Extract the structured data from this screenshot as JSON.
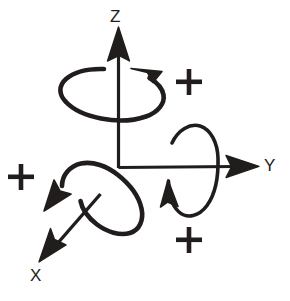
{
  "diagram": {
    "type": "hand-drawn-line-diagram",
    "background_color": "#ffffff",
    "ink_color": "#211d1c",
    "canvas": {
      "width": 290,
      "height": 301
    },
    "origin": {
      "x": 118,
      "y": 168
    },
    "axes": [
      {
        "id": "z",
        "label": "Z",
        "direction": "up",
        "label_position": {
          "x": 110,
          "y": 8
        },
        "arrow_tip": {
          "x": 118,
          "y": 27
        },
        "arrow_tail": {
          "x": 118,
          "y": 168
        }
      },
      {
        "id": "y",
        "label": "Y",
        "direction": "right",
        "label_position": {
          "x": 264,
          "y": 157
        },
        "arrow_tip": {
          "x": 258,
          "y": 166
        },
        "arrow_tail": {
          "x": 118,
          "y": 168
        }
      },
      {
        "id": "x",
        "label": "X",
        "direction": "down-left",
        "label_position": {
          "x": 30,
          "y": 267
        },
        "arrow_tip": {
          "x": 40,
          "y": 261
        },
        "arrow_tail": {
          "x": 100,
          "y": 195
        }
      }
    ],
    "rotations": [
      {
        "id": "rotation-z",
        "about_axis": "Z",
        "shape": "horizontal-ellipse",
        "center": {
          "x": 113,
          "y": 94
        },
        "radius_x": 50,
        "radius_y": 26,
        "sense": "counterclockwise-viewed-from-above",
        "arrowhead_position": {
          "x": 152,
          "y": 71
        },
        "sign_label": "+",
        "sign_position": {
          "x": 188,
          "y": 82
        }
      },
      {
        "id": "rotation-y",
        "about_axis": "Y",
        "shape": "vertical-ellipse",
        "center": {
          "x": 190,
          "y": 168
        },
        "radius_x": 27,
        "radius_y": 48,
        "sense": "counterclockwise-viewed-from-plus-y",
        "arrowhead_position": {
          "x": 172,
          "y": 193
        },
        "sign_label": "+",
        "sign_position": {
          "x": 188,
          "y": 240
        }
      },
      {
        "id": "rotation-x",
        "about_axis": "X",
        "shape": "tilted-ellipse",
        "center": {
          "x": 98,
          "y": 199
        },
        "radius_x": 50,
        "radius_y": 29,
        "tilt_degrees": -48,
        "sense": "counterclockwise-viewed-from-plus-x",
        "arrowhead_position": {
          "x": 55,
          "y": 196
        },
        "sign_label": "+",
        "sign_position": {
          "x": 20,
          "y": 177
        }
      }
    ],
    "plus_signs": [
      {
        "id": "plus-z",
        "label": "+",
        "x": 188,
        "y": 82
      },
      {
        "id": "plus-x",
        "label": "+",
        "x": 20,
        "y": 177
      },
      {
        "id": "plus-y",
        "label": "+",
        "x": 188,
        "y": 240
      }
    ]
  }
}
